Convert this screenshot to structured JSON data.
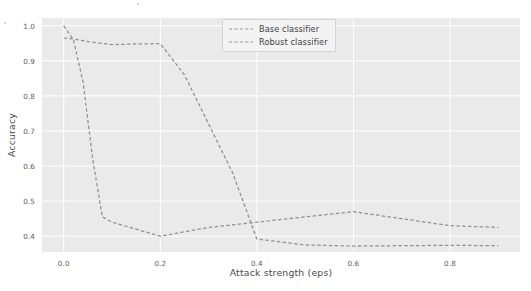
{
  "figure": {
    "background_color": "#ffffff",
    "axes_background_color": "#eaeaea",
    "grid_color": "#ffffff"
  },
  "chart_data": {
    "type": "line",
    "title": "",
    "xlabel": "Attack strength (eps)",
    "ylabel": "Accuracy",
    "xlim": [
      -0.045,
      0.945
    ],
    "ylim": [
      0.355,
      1.022
    ],
    "xticks": [
      0.0,
      0.2,
      0.4,
      0.6,
      0.8
    ],
    "xtick_labels": [
      "0.0",
      "0.2",
      "0.4",
      "0.6",
      "0.8"
    ],
    "yticks": [
      0.4,
      0.5,
      0.6,
      0.7,
      0.8,
      0.9,
      1.0
    ],
    "ytick_labels": [
      "0.4",
      "0.5",
      "0.6",
      "0.7",
      "0.8",
      "0.9",
      "1.0"
    ],
    "grid": true,
    "grid_axis": "both",
    "legend_position": "upper center-right",
    "linestyle": "dashed",
    "series": [
      {
        "name": "Base classifier",
        "color": "#8f8f8f",
        "linestyle": "dashed",
        "x": [
          0.0,
          0.02,
          0.04,
          0.06,
          0.08,
          0.1,
          0.15,
          0.2,
          0.3,
          0.4,
          0.5,
          0.6,
          0.7,
          0.8,
          0.9
        ],
        "y": [
          1.0,
          0.96,
          0.84,
          0.62,
          0.455,
          0.44,
          0.42,
          0.4,
          0.425,
          0.44,
          0.455,
          0.47,
          0.45,
          0.43,
          0.425
        ]
      },
      {
        "name": "Robust classifier",
        "color": "#8f8f8f",
        "linestyle": "dashed",
        "x": [
          0.0,
          0.02,
          0.05,
          0.1,
          0.15,
          0.2,
          0.25,
          0.3,
          0.35,
          0.4,
          0.5,
          0.6,
          0.7,
          0.8,
          0.9
        ],
        "y": [
          0.965,
          0.962,
          0.955,
          0.946,
          0.948,
          0.949,
          0.86,
          0.72,
          0.58,
          0.392,
          0.375,
          0.372,
          0.373,
          0.374,
          0.373
        ]
      }
    ],
    "annotations": []
  },
  "legend": {
    "entries": [
      {
        "label": "Base classifier"
      },
      {
        "label": "Robust classifier"
      }
    ]
  }
}
